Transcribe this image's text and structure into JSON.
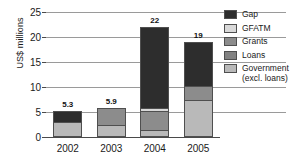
{
  "chart_data": {
    "type": "bar",
    "subtype": "stacked-bar",
    "title": "",
    "xlabel": "",
    "ylabel": "US$ millions",
    "categories": [
      "2002",
      "2003",
      "2004",
      "2005"
    ],
    "ylim": [
      0,
      25
    ],
    "yticks": [
      0,
      5,
      10,
      15,
      20,
      25
    ],
    "ytick_labels": [
      "0",
      "5",
      "10",
      "15",
      "20",
      "25"
    ],
    "grid": true,
    "legend_position": "right",
    "bar_total_labels": [
      "5.3",
      "5.9",
      "22",
      "19"
    ],
    "bar_totals": [
      5.3,
      5.9,
      22,
      19
    ],
    "stack_order_bottom_to_top": [
      "Government (excl. loans)",
      "Loans",
      "Grants",
      "GFATM",
      "Gap"
    ],
    "series": [
      {
        "name": "Government (excl. loans)",
        "legend_label_line1": "Government",
        "legend_label_line2": "(excl. loans)",
        "color": "#b9b9b9",
        "values": [
          3.0,
          2.4,
          1.5,
          7.4
        ]
      },
      {
        "name": "Loans",
        "legend_label_line1": "Loans",
        "legend_label_line2": "",
        "color": "#828282",
        "values": [
          0,
          0,
          0,
          0
        ]
      },
      {
        "name": "Grants",
        "legend_label_line1": "Grants",
        "legend_label_line2": "",
        "color": "#8c8c8c",
        "values": [
          0,
          3.5,
          3.7,
          2.8
        ]
      },
      {
        "name": "GFATM",
        "legend_label_line1": "GFATM",
        "legend_label_line2": "",
        "color": "#d9d9d9",
        "values": [
          0,
          0,
          0.6,
          0
        ]
      },
      {
        "name": "Gap",
        "legend_label_line1": "Gap",
        "legend_label_line2": "",
        "color": "#2d2d2d",
        "values": [
          2.3,
          0,
          16.2,
          8.8
        ]
      }
    ]
  },
  "colors": {
    "gap": "#2d2d2d",
    "gfatm": "#d9d9d9",
    "grants": "#8c8c8c",
    "loans": "#828282",
    "government": "#b9b9b9",
    "gridline": "#9a9a9a",
    "axis": "#4a4a4a",
    "background": "#ffffff",
    "text": "#1a1a1a"
  }
}
